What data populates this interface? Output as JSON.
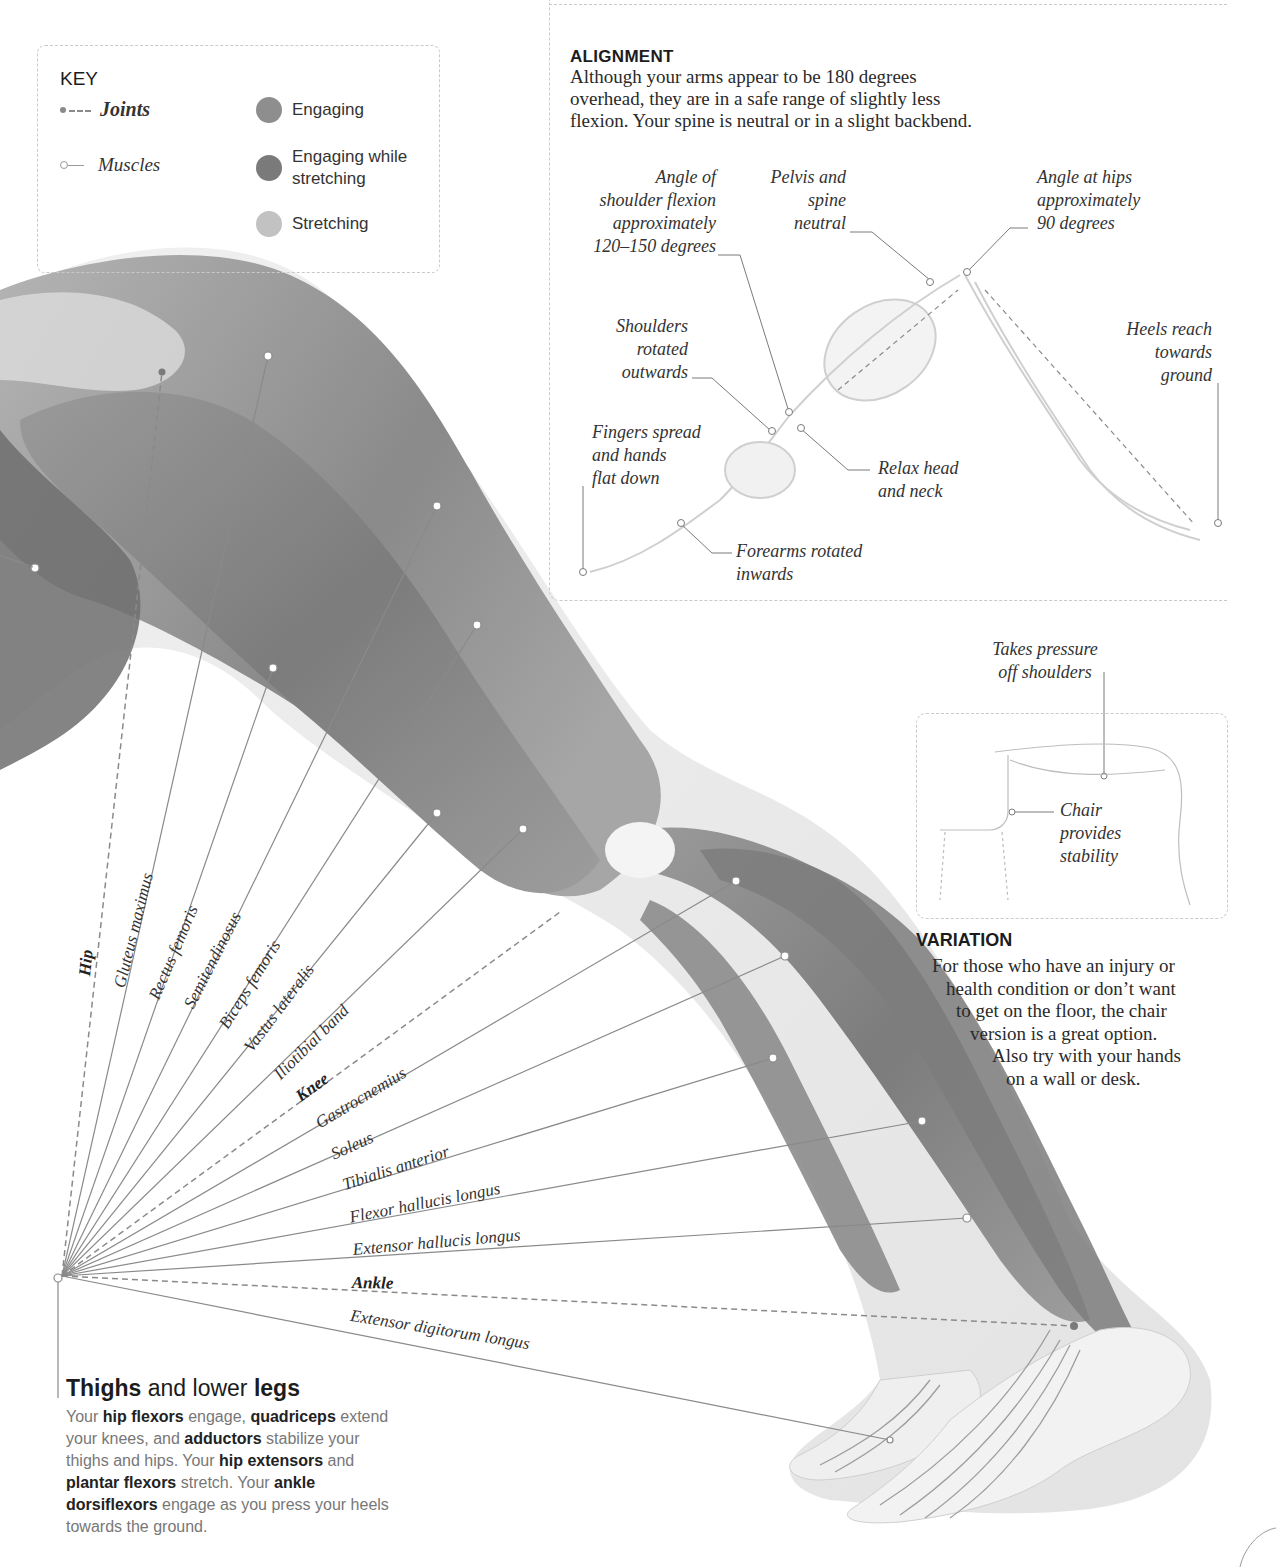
{
  "key": {
    "title": "KEY",
    "line_types": [
      {
        "label": "Joints",
        "style": "dashed-dot"
      },
      {
        "label": "Muscles",
        "style": "line-ring"
      }
    ],
    "swatches": [
      {
        "label": "Engaging",
        "color": "#8e8e8e"
      },
      {
        "label_line1": "Engaging while",
        "label_line2": "stretching",
        "color": "#7a7a7a"
      },
      {
        "label": "Stretching",
        "color": "#c2c2c2"
      }
    ]
  },
  "alignment": {
    "title": "ALIGNMENT",
    "body_lines": [
      "Although your arms appear to be 180 degrees",
      "overhead, they are in a safe range of slightly less",
      "flexion. Your spine is neutral or in a slight backbend."
    ],
    "callouts": {
      "shoulder_flexion": [
        "Angle of",
        "shoulder flexion",
        "approximately",
        "120–150 degrees"
      ],
      "pelvis_spine": [
        "Pelvis and",
        "spine",
        "neutral"
      ],
      "hips_angle": [
        "Angle at hips",
        "approximately",
        "90 degrees"
      ],
      "shoulders_rotated": [
        "Shoulders",
        "rotated",
        "outwards"
      ],
      "heels": [
        "Heels reach",
        "towards",
        "ground"
      ],
      "fingers": [
        "Fingers spread",
        "and hands",
        "flat down"
      ],
      "head_neck": [
        "Relax head",
        "and neck"
      ],
      "forearms": [
        "Forearms rotated",
        "inwards"
      ]
    }
  },
  "variation": {
    "callout_top": [
      "Takes pressure",
      "off shoulders"
    ],
    "callout_chair": [
      "Chair",
      "provides",
      "stability"
    ],
    "title": "VARIATION",
    "body_lines": [
      "For those who have an injury or",
      "health condition or don’t want",
      "to get on the floor, the chair",
      "version is a great option.",
      "Also try with your hands",
      "on a wall or desk."
    ]
  },
  "anatomy_labels": {
    "joints": [
      "Hip",
      "Knee",
      "Ankle"
    ],
    "muscles": [
      "Gluteus maximus",
      "Rectus femoris",
      "Semitendinosus",
      "Biceps femoris",
      "Vastus lateralis",
      "Iliotibial band",
      "Gastrocnemius",
      "Soleus",
      "Tibialis anterior",
      "Flexor hallucis longus",
      "Extensor hallucis longus",
      "Extensor digitorum longus"
    ]
  },
  "thighs": {
    "title_bold1": "Thighs",
    "title_mid": " and lower ",
    "title_bold2": "legs",
    "body": [
      {
        "t": "Your ",
        "b": false
      },
      {
        "t": "hip flexors",
        "b": true
      },
      {
        "t": " engage, ",
        "b": false
      },
      {
        "t": "quadriceps",
        "b": true
      },
      {
        "t": " extend your knees, and ",
        "b": false
      },
      {
        "t": "adductors",
        "b": true
      },
      {
        "t": " stabilize your thighs and hips. Your ",
        "b": false
      },
      {
        "t": "hip extensors",
        "b": true
      },
      {
        "t": " and ",
        "b": false
      },
      {
        "t": "plantar flexors",
        "b": true
      },
      {
        "t": " stretch. Your ",
        "b": false
      },
      {
        "t": "ankle dorsiflexors",
        "b": true
      },
      {
        "t": " engage as you press your heels towards the ground.",
        "b": false
      }
    ]
  },
  "colors": {
    "engaging": "#8e8e8e",
    "engaging_stretching": "#7a7a7a",
    "stretching": "#c2c2c2",
    "leader_line": "#8a8a8a",
    "dashed_border": "#c9c9c9"
  }
}
